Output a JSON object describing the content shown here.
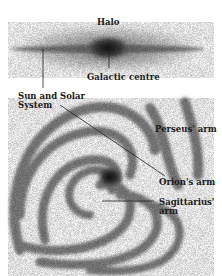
{
  "diagram": {
    "type": "milky-way-structure",
    "side_view": {
      "labels": {
        "halo": "Halo",
        "galactic_centre": "Galactic centre"
      }
    },
    "face_on_view": {
      "labels": {
        "sun": "Sun and Solar System",
        "sun_line1": "Sun and Solar",
        "sun_line2": "System",
        "perseus": "Perseus' arm",
        "orion": "Orion's arm",
        "sagittarius_line1": "Sagittarius'",
        "sagittarius_line2": "arm"
      }
    },
    "colors": {
      "background": "#ffffff",
      "ink": "#1a1a1a",
      "halo_gray": "#bdbdbd",
      "core_dark": "#2a2a2a"
    }
  }
}
